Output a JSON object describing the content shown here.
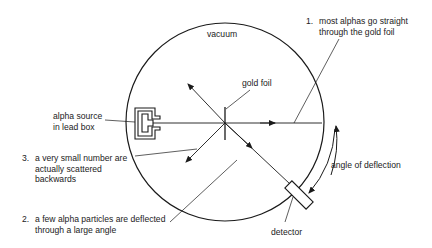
{
  "diagram": {
    "labels": {
      "vacuum": "vacuum",
      "gold_foil": "gold foil",
      "alpha_source_line1": "alpha source",
      "alpha_source_line2": "in lead box",
      "detector": "detector",
      "angle_of_deflection": "angle of deflection"
    },
    "observations": [
      {
        "number": "1.",
        "lines": [
          "most alphas go straight",
          "through the gold foil"
        ]
      },
      {
        "number": "2.",
        "lines": [
          "a few alpha particles are deflected",
          "through a large angle"
        ]
      },
      {
        "number": "3.",
        "lines": [
          "a very small number are",
          "actually scattered",
          "backwards"
        ]
      }
    ],
    "colors": {
      "line": "#1a1a1a",
      "background": "#ffffff"
    }
  }
}
